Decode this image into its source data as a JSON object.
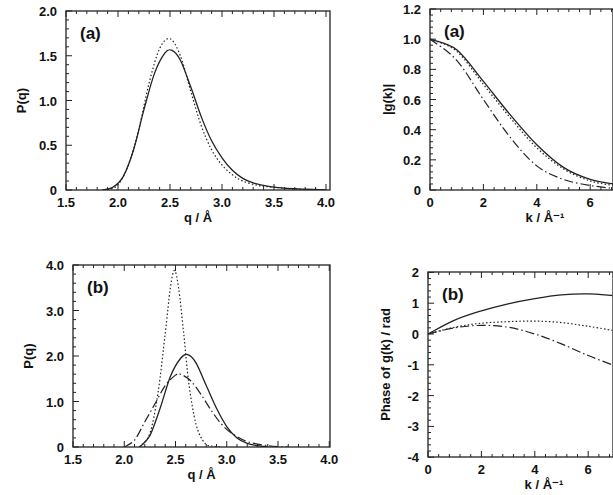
{
  "chart_data": [
    {
      "id": "top-left",
      "type": "line",
      "panel_label": "(a)",
      "xlabel": "q / Å",
      "ylabel": "P(q)",
      "xlim": [
        1.5,
        4.0
      ],
      "ylim": [
        0,
        2.0
      ],
      "xticks": [
        1.5,
        2.0,
        2.5,
        3.0,
        3.5,
        4.0
      ],
      "xtick_labels": [
        "1.5",
        "2.0",
        "2.5",
        "3.0",
        "3.5",
        "4.0"
      ],
      "yticks": [
        0,
        0.5,
        1.0,
        1.5,
        2.0
      ],
      "ytick_labels": [
        "0",
        "0.5",
        "1.0",
        "1.5",
        "2.0"
      ],
      "frame": {
        "left": 66,
        "top": 11,
        "right": 330,
        "bottom": 190,
        "x0": 66,
        "xscale": 104,
        "y0": 190,
        "yscale": 89.5
      },
      "series": [
        {
          "name": "solid",
          "style": "solid",
          "x": [
            1.85,
            1.95,
            2.05,
            2.15,
            2.25,
            2.35,
            2.45,
            2.52,
            2.6,
            2.7,
            2.8,
            2.9,
            3.0,
            3.1,
            3.2,
            3.3,
            3.45,
            3.6,
            3.8,
            4.0
          ],
          "y": [
            0.0,
            0.03,
            0.15,
            0.45,
            0.9,
            1.3,
            1.53,
            1.56,
            1.45,
            1.15,
            0.82,
            0.55,
            0.36,
            0.22,
            0.13,
            0.08,
            0.04,
            0.02,
            0.01,
            0.0
          ]
        },
        {
          "name": "dotted",
          "style": "dotted",
          "x": [
            1.9,
            2.0,
            2.1,
            2.2,
            2.3,
            2.4,
            2.5,
            2.6,
            2.7,
            2.8,
            2.9,
            3.0,
            3.1,
            3.2,
            3.35,
            3.5,
            3.7,
            3.9
          ],
          "y": [
            0.0,
            0.06,
            0.28,
            0.68,
            1.2,
            1.58,
            1.69,
            1.5,
            1.1,
            0.72,
            0.45,
            0.28,
            0.17,
            0.1,
            0.05,
            0.03,
            0.01,
            0.0
          ]
        }
      ]
    },
    {
      "id": "top-right",
      "type": "line",
      "panel_label": "(a)",
      "xlabel": "k / Å⁻¹",
      "ylabel": "|g(k)|",
      "xlim": [
        0,
        6.9
      ],
      "ylim": [
        0,
        1.2
      ],
      "xticks": [
        0,
        2,
        4,
        6
      ],
      "xtick_labels": [
        "0",
        "2",
        "4",
        "6"
      ],
      "yticks": [
        0,
        0.2,
        0.4,
        0.6,
        0.8,
        1.0,
        1.2
      ],
      "ytick_labels": [
        "0",
        "0.2",
        "0.4",
        "0.6",
        "0.8",
        "1.0",
        "1.2"
      ],
      "frame": {
        "left": 430,
        "top": 9,
        "right": 613,
        "bottom": 190,
        "x0": 430,
        "xscale": 26.7,
        "y0": 190,
        "yscale": 150.8
      },
      "series": [
        {
          "name": "solid",
          "style": "solid",
          "x": [
            0,
            1,
            2,
            3,
            4,
            5,
            6,
            6.9
          ],
          "y": [
            1.0,
            0.93,
            0.72,
            0.5,
            0.3,
            0.15,
            0.07,
            0.04
          ]
        },
        {
          "name": "dotted",
          "style": "dotted",
          "x": [
            0,
            1,
            2,
            3,
            4,
            5,
            6,
            6.9
          ],
          "y": [
            1.0,
            0.92,
            0.7,
            0.48,
            0.28,
            0.14,
            0.06,
            0.03
          ]
        },
        {
          "name": "dash-dot",
          "style": "dashdot",
          "x": [
            0,
            1,
            2,
            3,
            4,
            5,
            6,
            6.9
          ],
          "y": [
            1.0,
            0.86,
            0.6,
            0.35,
            0.16,
            0.07,
            0.03,
            0.01
          ]
        }
      ]
    },
    {
      "id": "bottom-left",
      "type": "line",
      "panel_label": "(b)",
      "xlabel": "q / Å",
      "ylabel": "P(q)",
      "xlim": [
        1.5,
        4.0
      ],
      "ylim": [
        0,
        4.0
      ],
      "xticks": [
        1.5,
        2.0,
        2.5,
        3.0,
        3.5,
        4.0
      ],
      "xtick_labels": [
        "1.5",
        "2.0",
        "2.5",
        "3.0",
        "3.5",
        "4.0"
      ],
      "yticks": [
        0,
        1.0,
        2.0,
        3.0,
        4.0
      ],
      "ytick_labels": [
        "0",
        "1.0",
        "2.0",
        "3.0",
        "4.0"
      ],
      "frame": {
        "left": 73,
        "top": 265,
        "right": 330,
        "bottom": 447,
        "x0": 73,
        "xscale": 102.5,
        "y0": 447,
        "yscale": 45.5
      },
      "series": [
        {
          "name": "dotted",
          "style": "dotted",
          "x": [
            2.15,
            2.25,
            2.33,
            2.4,
            2.45,
            2.49,
            2.53,
            2.58,
            2.63,
            2.7,
            2.78,
            2.85,
            2.95
          ],
          "y": [
            0.0,
            0.3,
            1.2,
            2.5,
            3.5,
            3.88,
            3.5,
            2.5,
            1.4,
            0.5,
            0.1,
            0.02,
            0.0
          ]
        },
        {
          "name": "solid",
          "style": "solid",
          "x": [
            2.15,
            2.25,
            2.35,
            2.45,
            2.55,
            2.62,
            2.7,
            2.8,
            2.9,
            3.0,
            3.1,
            3.2,
            3.3,
            3.4
          ],
          "y": [
            0.0,
            0.25,
            0.85,
            1.55,
            1.95,
            2.03,
            1.85,
            1.35,
            0.85,
            0.45,
            0.2,
            0.08,
            0.03,
            0.0
          ]
        },
        {
          "name": "dash-dot",
          "style": "dashdot",
          "x": [
            2.0,
            2.1,
            2.2,
            2.3,
            2.4,
            2.5,
            2.55,
            2.65,
            2.75,
            2.85,
            2.95,
            3.05,
            3.2,
            3.4,
            3.6
          ],
          "y": [
            0.0,
            0.15,
            0.55,
            0.95,
            1.35,
            1.58,
            1.6,
            1.45,
            1.15,
            0.8,
            0.5,
            0.3,
            0.12,
            0.03,
            0.0
          ]
        }
      ]
    },
    {
      "id": "bottom-right",
      "type": "line",
      "panel_label": "(b)",
      "xlabel": "k / Å⁻¹",
      "ylabel": "Phase of g(k) / rad",
      "xlim": [
        0,
        6.9
      ],
      "ylim": [
        -4,
        2
      ],
      "xticks": [
        0,
        2,
        4,
        6
      ],
      "xtick_labels": [
        "0",
        "2",
        "4",
        "6"
      ],
      "yticks": [
        -4,
        -3,
        -2,
        -1,
        0,
        1,
        2
      ],
      "ytick_labels": [
        "-4",
        "-3",
        "-2",
        "-1",
        "0",
        "1",
        "2"
      ],
      "frame": {
        "left": 428,
        "top": 272,
        "right": 613,
        "bottom": 457,
        "x0": 428,
        "xscale": 26.7,
        "y0": 334,
        "yscale": 30.8
      },
      "series": [
        {
          "name": "solid",
          "style": "solid",
          "x": [
            0,
            1,
            2,
            3,
            4,
            5,
            6,
            6.9
          ],
          "y": [
            0.0,
            0.45,
            0.75,
            0.98,
            1.15,
            1.27,
            1.3,
            1.25
          ]
        },
        {
          "name": "dotted",
          "style": "dotted",
          "x": [
            0,
            1,
            2,
            3,
            4,
            5,
            6,
            6.9
          ],
          "y": [
            0.0,
            0.22,
            0.35,
            0.4,
            0.42,
            0.37,
            0.25,
            0.12
          ]
        },
        {
          "name": "dash-dot",
          "style": "dashdot",
          "x": [
            0,
            1,
            2,
            3,
            4,
            5,
            6,
            6.9
          ],
          "y": [
            0.0,
            0.2,
            0.28,
            0.22,
            0.0,
            -0.32,
            -0.7,
            -1.0
          ]
        }
      ]
    }
  ]
}
